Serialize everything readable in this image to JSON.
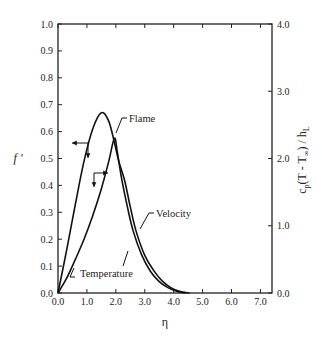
{
  "chart_data": {
    "type": "line",
    "title": "",
    "xlabel": "η",
    "ylabel": "f '",
    "ylabel_right": "cp(T - T∞) / hL",
    "xlim": [
      0.0,
      7.4
    ],
    "ylim": [
      0.0,
      1.0
    ],
    "ylim_right": [
      0.0,
      4.0
    ],
    "grid": false,
    "legend": "none (curves labeled by annotations)",
    "x_ticks": [
      "0.0",
      "1.0",
      "2.0",
      "3.0",
      "4.0",
      "5.0",
      "6.0",
      "7.0"
    ],
    "y_ticks": [
      "0.0",
      "0.1",
      "0.2",
      "0.3",
      "0.4",
      "0.5",
      "0.6",
      "0.7",
      "0.8",
      "0.9",
      "1.0"
    ],
    "y_ticks_right": [
      "0.0",
      "1.0",
      "2.0",
      "3.0",
      "4.0"
    ],
    "series": [
      {
        "name": "Velocity",
        "axis": "left",
        "x": [
          0.0,
          0.3,
          0.6,
          0.9,
          1.2,
          1.5,
          1.75,
          1.95,
          2.1,
          2.3,
          2.5,
          2.7,
          3.0,
          3.3,
          3.6,
          3.9,
          4.2,
          4.55
        ],
        "values": [
          0.0,
          0.16,
          0.33,
          0.49,
          0.61,
          0.67,
          0.64,
          0.56,
          0.49,
          0.42,
          0.32,
          0.23,
          0.14,
          0.085,
          0.045,
          0.02,
          0.006,
          0.0
        ]
      },
      {
        "name": "Temperature",
        "axis": "right",
        "x": [
          0.0,
          0.3,
          0.6,
          0.9,
          1.2,
          1.5,
          1.75,
          1.95,
          2.05,
          2.2,
          2.4,
          2.6,
          2.9,
          3.2,
          3.5,
          3.8,
          4.1,
          4.4
        ],
        "values": [
          0.0,
          0.22,
          0.5,
          0.8,
          1.15,
          1.55,
          1.95,
          2.3,
          2.1,
          1.7,
          1.28,
          0.92,
          0.56,
          0.32,
          0.17,
          0.08,
          0.025,
          0.0
        ]
      }
    ],
    "annotations": [
      {
        "text": "Flame",
        "x": 2.15,
        "y": 0.66,
        "points_to": [
          1.95,
          0.58
        ]
      },
      {
        "text": "Velocity",
        "x": 3.3,
        "y": 0.4,
        "points_to": [
          2.75,
          0.3
        ]
      },
      {
        "text": "Temperature",
        "x": 0.55,
        "y": 0.06,
        "points_to": [
          0.45,
          0.105
        ]
      },
      {
        "text": "arrow-left-axis",
        "from": [
          1.0,
          0.56
        ],
        "to": [
          0.45,
          0.56
        ],
        "down_to": 0.5
      },
      {
        "text": "arrow-right-axis",
        "from": [
          1.2,
          0.45
        ],
        "to": [
          1.7,
          0.45
        ],
        "down_to": 0.4
      }
    ]
  },
  "labels": {
    "xlabel": "η",
    "ylabel": "f '",
    "ylabel_right_main": "c",
    "ylabel_right_sub_p": "p",
    "ylabel_right_mid": "(T - T",
    "ylabel_right_inf": "∞",
    "ylabel_right_end": ") / h",
    "ylabel_right_sub_L": "L",
    "flame": "Flame",
    "velocity": "Velocity",
    "temperature": "Temperature"
  },
  "colors": {
    "line": "#111111",
    "axis": "#222222",
    "background": "#ffffff"
  }
}
